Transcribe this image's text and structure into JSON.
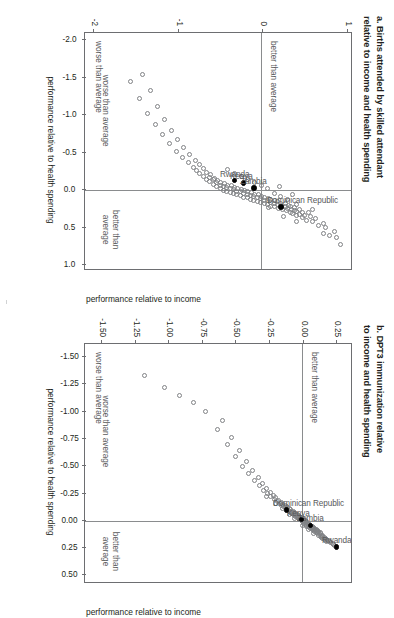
{
  "figure": {
    "orientation": "rotated-90-clockwise",
    "background": "#ffffff",
    "marker_outline_color": "#808285",
    "highlight_color": "#000000",
    "reference_line_color": "#8a8c8e"
  },
  "panels": [
    {
      "id": "a",
      "title_line1": "a. Births attended by skilled attendant",
      "title_line2": "relative to income and health spending",
      "x_axis_title": "performance relative to income",
      "y_axis_title": "performance relative to health spending",
      "x_ticks": [
        "-2.0",
        "-1.5",
        "-1.0",
        "-0.5",
        "0.0",
        "0.5",
        "1.0"
      ],
      "y_ticks": [
        "1",
        "0",
        "-1",
        "-2"
      ],
      "quadrant_notes": {
        "top_left": "better than average",
        "bottom_left": "worse than average",
        "x_better": "better than",
        "x_better2": "average",
        "x_worse": "worse than average"
      },
      "country_labels": [
        "Dominican Republic",
        "Kenya",
        "Zambia",
        "Rwanda"
      ]
    },
    {
      "id": "b",
      "title_line1": "b. DPT3 immunization relative",
      "title_line2": "to income and health spending",
      "x_axis_title": "performance relative to income",
      "y_axis_title": "performance relative to health spending",
      "x_ticks": [
        "-1.50",
        "-1.25",
        "-1.00",
        "-0.75",
        "-0.50",
        "-0.25",
        "0.00",
        "0.25",
        "0.50"
      ],
      "y_ticks": [
        "0.25",
        "0.00",
        "-0.25",
        "-0.50",
        "-0.75",
        "-1.00",
        "-1.25",
        "-1.50"
      ],
      "quadrant_notes": {
        "top_left": "better than average",
        "bottom_left": "worse than average",
        "x_better": "better than",
        "x_better2": "average",
        "x_worse": "worse than average"
      },
      "country_labels": [
        "Rwanda",
        "Zambia",
        "Kenya",
        "Dominican Republic"
      ]
    }
  ],
  "chart_data": [
    {
      "type": "scatter",
      "panel": "a",
      "title": "a. Births attended by skilled attendant relative to income and health spending",
      "xlabel": "performance relative to income",
      "ylabel": "performance relative to health spending",
      "xlim": [
        -2.1,
        1.05
      ],
      "ylim": [
        -2.1,
        1.05
      ],
      "xticks": [
        -2.0,
        -1.5,
        -1.0,
        -0.5,
        0.0,
        0.5,
        1.0
      ],
      "yticks": [
        1,
        0,
        -1,
        -2
      ],
      "grid": false,
      "reference_lines": {
        "x": 0.0,
        "y": 0.0
      },
      "legend": "none",
      "annotations": [
        {
          "text": "better than average",
          "quadrant": "upper-left"
        },
        {
          "text": "worse than average",
          "quadrant": "lower-left"
        },
        {
          "text": "better than average",
          "axis": "x-positive"
        },
        {
          "text": "worse than average",
          "axis": "x-negative"
        }
      ],
      "highlighted": [
        {
          "name": "Dominican Republic",
          "x": 0.22,
          "y": 0.22
        },
        {
          "name": "Kenya",
          "x": -0.1,
          "y": -0.22
        },
        {
          "name": "Zambia",
          "x": -0.03,
          "y": -0.1
        },
        {
          "name": "Rwanda",
          "x": -0.13,
          "y": -0.33
        }
      ],
      "points": [
        [
          0.72,
          0.93
        ],
        [
          0.63,
          0.88
        ],
        [
          0.6,
          0.8
        ],
        [
          0.55,
          0.86
        ],
        [
          0.5,
          0.75
        ],
        [
          0.47,
          0.67
        ],
        [
          0.44,
          0.72
        ],
        [
          0.41,
          0.6
        ],
        [
          0.4,
          0.52
        ],
        [
          0.38,
          0.63
        ],
        [
          0.36,
          0.48
        ],
        [
          0.35,
          0.57
        ],
        [
          0.34,
          0.4
        ],
        [
          0.33,
          0.5
        ],
        [
          0.32,
          0.44
        ],
        [
          0.31,
          0.36
        ],
        [
          0.3,
          0.47
        ],
        [
          0.29,
          0.33
        ],
        [
          0.28,
          0.41
        ],
        [
          0.27,
          0.29
        ],
        [
          0.27,
          0.38
        ],
        [
          0.26,
          0.24
        ],
        [
          0.25,
          0.34
        ],
        [
          0.25,
          0.44
        ],
        [
          0.24,
          0.19
        ],
        [
          0.24,
          0.3
        ],
        [
          0.23,
          0.38
        ],
        [
          0.22,
          0.15
        ],
        [
          0.22,
          0.27
        ],
        [
          0.21,
          0.33
        ],
        [
          0.21,
          0.1
        ],
        [
          0.2,
          0.23
        ],
        [
          0.2,
          0.31
        ],
        [
          0.19,
          0.06
        ],
        [
          0.19,
          0.18
        ],
        [
          0.18,
          0.27
        ],
        [
          0.18,
          0.02
        ],
        [
          0.17,
          0.14
        ],
        [
          0.17,
          0.22
        ],
        [
          0.16,
          -0.02
        ],
        [
          0.16,
          0.1
        ],
        [
          0.15,
          0.18
        ],
        [
          0.15,
          -0.06
        ],
        [
          0.14,
          0.06
        ],
        [
          0.14,
          0.14
        ],
        [
          0.13,
          -0.1
        ],
        [
          0.13,
          0.02
        ],
        [
          0.12,
          0.1
        ],
        [
          0.12,
          -0.14
        ],
        [
          0.11,
          -0.02
        ],
        [
          0.11,
          0.07
        ],
        [
          0.1,
          -0.18
        ],
        [
          0.1,
          -0.06
        ],
        [
          0.09,
          0.03
        ],
        [
          0.09,
          -0.22
        ],
        [
          0.08,
          -0.1
        ],
        [
          0.08,
          -0.01
        ],
        [
          0.07,
          -0.26
        ],
        [
          0.07,
          -0.14
        ],
        [
          0.06,
          -0.05
        ],
        [
          0.06,
          -0.3
        ],
        [
          0.05,
          -0.18
        ],
        [
          0.05,
          -0.09
        ],
        [
          0.04,
          -0.34
        ],
        [
          0.04,
          -0.22
        ],
        [
          0.03,
          -0.13
        ],
        [
          0.03,
          -0.38
        ],
        [
          0.02,
          -0.26
        ],
        [
          0.02,
          -0.17
        ],
        [
          0.01,
          -0.42
        ],
        [
          0.01,
          -0.3
        ],
        [
          0.0,
          -0.21
        ],
        [
          0.0,
          -0.46
        ],
        [
          -0.01,
          -0.34
        ],
        [
          -0.01,
          -0.25
        ],
        [
          -0.02,
          -0.5
        ],
        [
          -0.02,
          -0.38
        ],
        [
          -0.03,
          -0.29
        ],
        [
          -0.04,
          -0.42
        ],
        [
          -0.04,
          -0.33
        ],
        [
          -0.05,
          -0.54
        ],
        [
          -0.05,
          -0.46
        ],
        [
          -0.06,
          -0.37
        ],
        [
          -0.07,
          -0.5
        ],
        [
          -0.07,
          -0.41
        ],
        [
          -0.08,
          -0.58
        ],
        [
          -0.09,
          -0.45
        ],
        [
          -0.1,
          -0.54
        ],
        [
          -0.11,
          -0.49
        ],
        [
          -0.12,
          -0.62
        ],
        [
          -0.13,
          -0.53
        ],
        [
          -0.14,
          -0.58
        ],
        [
          -0.15,
          -0.66
        ],
        [
          -0.16,
          -0.57
        ],
        [
          -0.17,
          -0.62
        ],
        [
          -0.19,
          -0.7
        ],
        [
          -0.21,
          -0.61
        ],
        [
          -0.22,
          -0.74
        ],
        [
          -0.24,
          -0.66
        ],
        [
          -0.26,
          -0.78
        ],
        [
          -0.29,
          -0.7
        ],
        [
          -0.31,
          -0.82
        ],
        [
          -0.34,
          -0.74
        ],
        [
          -0.37,
          -0.87
        ],
        [
          -0.4,
          -0.79
        ],
        [
          -0.44,
          -0.95
        ],
        [
          -0.48,
          -0.86
        ],
        [
          -0.52,
          -1.02
        ],
        [
          -0.57,
          -0.93
        ],
        [
          -0.62,
          -1.1
        ],
        [
          -0.68,
          -1.0
        ],
        [
          -0.74,
          -1.18
        ],
        [
          -0.8,
          -1.08
        ],
        [
          -0.88,
          -1.27
        ],
        [
          -0.95,
          -1.16
        ],
        [
          -1.03,
          -1.36
        ],
        [
          -1.12,
          -1.24
        ],
        [
          -1.22,
          -1.46
        ],
        [
          -1.33,
          -1.33
        ],
        [
          -1.45,
          -1.56
        ],
        [
          -1.55,
          -1.42
        ],
        [
          0.42,
          0.41
        ],
        [
          0.3,
          0.55
        ],
        [
          0.58,
          0.72
        ],
        [
          0.26,
          0.6
        ],
        [
          0.12,
          0.3
        ],
        [
          0.08,
          0.22
        ],
        [
          0.04,
          0.14
        ],
        [
          -0.02,
          0.06
        ],
        [
          -0.06,
          -0.01
        ],
        [
          -0.1,
          -0.09
        ],
        [
          -0.14,
          -0.17
        ],
        [
          -0.18,
          -0.25
        ],
        [
          -0.23,
          -0.33
        ],
        [
          -0.28,
          -0.41
        ],
        [
          0.35,
          0.25
        ],
        [
          0.19,
          0.41
        ],
        [
          0.23,
          0.07
        ],
        [
          0.06,
          0.36
        ],
        [
          -0.05,
          0.2
        ]
      ]
    },
    {
      "type": "scatter",
      "panel": "b",
      "title": "b. DPT3 immunization relative to income and health spending",
      "xlabel": "performance relative to income",
      "ylabel": "performance relative to health spending",
      "xlim": [
        -1.62,
        0.56
      ],
      "ylim": [
        -1.62,
        0.36
      ],
      "xticks": [
        -1.5,
        -1.25,
        -1.0,
        -0.75,
        -0.5,
        -0.25,
        0.0,
        0.25,
        0.5
      ],
      "yticks": [
        0.25,
        0.0,
        -0.25,
        -0.5,
        -0.75,
        -1.0,
        -1.25,
        -1.5
      ],
      "grid": false,
      "reference_lines": {
        "x": 0.0,
        "y": 0.0
      },
      "legend": "none",
      "annotations": [
        {
          "text": "better than average",
          "quadrant": "upper-left"
        },
        {
          "text": "worse than average",
          "quadrant": "lower-left"
        },
        {
          "text": "better than average",
          "axis": "x-positive"
        },
        {
          "text": "worse than average",
          "axis": "x-negative"
        }
      ],
      "highlighted": [
        {
          "name": "Rwanda",
          "x": 0.24,
          "y": 0.25
        },
        {
          "name": "Zambia",
          "x": 0.04,
          "y": 0.06
        },
        {
          "name": "Kenya",
          "x": -0.01,
          "y": -0.01
        },
        {
          "name": "Dominican Republic",
          "x": -0.1,
          "y": -0.12
        }
      ],
      "points": [
        [
          0.23,
          0.24
        ],
        [
          0.22,
          0.23
        ],
        [
          0.21,
          0.22
        ],
        [
          0.2,
          0.21
        ],
        [
          0.19,
          0.2
        ],
        [
          0.19,
          0.18
        ],
        [
          0.18,
          0.19
        ],
        [
          0.18,
          0.17
        ],
        [
          0.17,
          0.18
        ],
        [
          0.17,
          0.16
        ],
        [
          0.16,
          0.17
        ],
        [
          0.16,
          0.15
        ],
        [
          0.15,
          0.16
        ],
        [
          0.15,
          0.14
        ],
        [
          0.14,
          0.15
        ],
        [
          0.14,
          0.13
        ],
        [
          0.13,
          0.14
        ],
        [
          0.13,
          0.12
        ],
        [
          0.13,
          0.15
        ],
        [
          0.12,
          0.13
        ],
        [
          0.12,
          0.11
        ],
        [
          0.11,
          0.12
        ],
        [
          0.11,
          0.1
        ],
        [
          0.11,
          0.13
        ],
        [
          0.1,
          0.11
        ],
        [
          0.1,
          0.09
        ],
        [
          0.1,
          0.12
        ],
        [
          0.09,
          0.1
        ],
        [
          0.09,
          0.08
        ],
        [
          0.09,
          0.11
        ],
        [
          0.08,
          0.09
        ],
        [
          0.08,
          0.07
        ],
        [
          0.08,
          0.1
        ],
        [
          0.07,
          0.08
        ],
        [
          0.07,
          0.06
        ],
        [
          0.07,
          0.09
        ],
        [
          0.06,
          0.07
        ],
        [
          0.06,
          0.05
        ],
        [
          0.06,
          0.08
        ],
        [
          0.05,
          0.06
        ],
        [
          0.05,
          0.04
        ],
        [
          0.05,
          0.07
        ],
        [
          0.05,
          0.03
        ],
        [
          0.04,
          0.05
        ],
        [
          0.04,
          0.03
        ],
        [
          0.04,
          0.06
        ],
        [
          0.03,
          0.04
        ],
        [
          0.03,
          0.02
        ],
        [
          0.03,
          0.05
        ],
        [
          0.02,
          0.03
        ],
        [
          0.02,
          0.01
        ],
        [
          0.02,
          0.04
        ],
        [
          0.01,
          0.02
        ],
        [
          0.01,
          0.0
        ],
        [
          0.01,
          0.03
        ],
        [
          0.0,
          0.01
        ],
        [
          0.0,
          -0.01
        ],
        [
          0.0,
          0.02
        ],
        [
          -0.01,
          0.0
        ],
        [
          -0.01,
          -0.02
        ],
        [
          -0.01,
          0.01
        ],
        [
          -0.02,
          -0.01
        ],
        [
          -0.02,
          -0.03
        ],
        [
          -0.02,
          0.0
        ],
        [
          -0.03,
          -0.02
        ],
        [
          -0.03,
          -0.04
        ],
        [
          -0.03,
          -0.01
        ],
        [
          -0.04,
          -0.03
        ],
        [
          -0.04,
          -0.05
        ],
        [
          -0.04,
          -0.02
        ],
        [
          -0.05,
          -0.04
        ],
        [
          -0.05,
          -0.06
        ],
        [
          -0.05,
          -0.03
        ],
        [
          -0.06,
          -0.05
        ],
        [
          -0.06,
          -0.07
        ],
        [
          -0.06,
          -0.04
        ],
        [
          -0.07,
          -0.06
        ],
        [
          -0.07,
          -0.08
        ],
        [
          -0.07,
          -0.05
        ],
        [
          -0.08,
          -0.07
        ],
        [
          -0.08,
          -0.09
        ],
        [
          -0.08,
          -0.06
        ],
        [
          -0.09,
          -0.08
        ],
        [
          -0.09,
          -0.1
        ],
        [
          -0.09,
          -0.07
        ],
        [
          -0.1,
          -0.09
        ],
        [
          -0.1,
          -0.11
        ],
        [
          -0.11,
          -0.1
        ],
        [
          -0.11,
          -0.12
        ],
        [
          -0.12,
          -0.11
        ],
        [
          -0.12,
          -0.13
        ],
        [
          -0.13,
          -0.12
        ],
        [
          -0.13,
          -0.14
        ],
        [
          -0.14,
          -0.13
        ],
        [
          -0.14,
          -0.16
        ],
        [
          -0.15,
          -0.15
        ],
        [
          -0.16,
          -0.17
        ],
        [
          -0.17,
          -0.16
        ],
        [
          -0.18,
          -0.19
        ],
        [
          -0.19,
          -0.18
        ],
        [
          -0.2,
          -0.21
        ],
        [
          -0.21,
          -0.2
        ],
        [
          -0.22,
          -0.24
        ],
        [
          -0.23,
          -0.22
        ],
        [
          -0.25,
          -0.26
        ],
        [
          -0.26,
          -0.24
        ],
        [
          -0.28,
          -0.29
        ],
        [
          -0.3,
          -0.27
        ],
        [
          -0.32,
          -0.32
        ],
        [
          -0.34,
          -0.3
        ],
        [
          -0.37,
          -0.36
        ],
        [
          -0.4,
          -0.33
        ],
        [
          -0.43,
          -0.4
        ],
        [
          -0.46,
          -0.37
        ],
        [
          -0.5,
          -0.45
        ],
        [
          -0.54,
          -0.42
        ],
        [
          -0.59,
          -0.5
        ],
        [
          -0.64,
          -0.47
        ],
        [
          -0.7,
          -0.56
        ],
        [
          -0.76,
          -0.53
        ],
        [
          -0.84,
          -0.63
        ],
        [
          -0.92,
          -0.6
        ],
        [
          -1.0,
          -0.72
        ],
        [
          -1.08,
          -0.81
        ],
        [
          -1.15,
          -0.92
        ],
        [
          -1.22,
          -1.03
        ],
        [
          -1.33,
          -1.18
        ],
        [
          0.12,
          0.08
        ],
        [
          0.08,
          0.04
        ],
        [
          0.04,
          0.0
        ],
        [
          -0.02,
          -0.06
        ],
        [
          -0.06,
          -0.1
        ],
        [
          -0.11,
          -0.15
        ],
        [
          -0.16,
          -0.2
        ],
        [
          -0.22,
          -0.27
        ]
      ]
    }
  ]
}
